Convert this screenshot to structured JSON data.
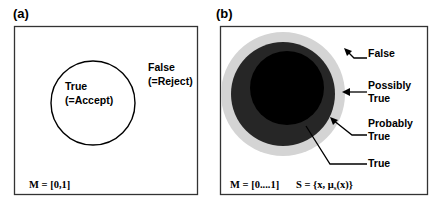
{
  "panels": {
    "a": {
      "label": "(a)",
      "inside_label_line1": "True",
      "inside_label_line2": "(=Accept)",
      "outside_label_line1": "False",
      "outside_label_line2": "(=Reject)",
      "membership": "M = [0,1]"
    },
    "b": {
      "label": "(b)",
      "labels": {
        "false": "False",
        "possibly_line1": "Possibly",
        "possibly_line2": "True",
        "probably_line1": "Probably",
        "probably_line2": "True",
        "true": "True"
      },
      "membership": "M = [0....1]",
      "set_definition": "S = {x, μ",
      "set_subscript": "s",
      "set_definition_end": "(x)}"
    }
  },
  "colors": {
    "outer_ring": "#d4d4d4",
    "middle_ring": "#262626",
    "core": "#000000",
    "border": "#333333"
  }
}
